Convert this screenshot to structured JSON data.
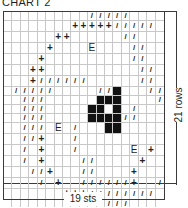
{
  "title": "CHART 2",
  "dimensions": {
    "width_label": "19 sts",
    "height_label": "21 rows",
    "columns": 19,
    "rows": 21
  },
  "legend_symbols": {
    "/": "slash",
    "+": "plus",
    "#": "filled-square",
    "E": "letter-E",
    ".": "empty"
  },
  "colors": {
    "ink": "#231f20",
    "gridline": "#c8c8c8",
    "filled": "#111111"
  },
  "grid": [
    "........../////....",
    "........+++++/////.",
    "......++......//...",
    ".....+....E....//..",
    "....+..........//..",
    "...++...........//.",
    "...+//////......//.",
    "./////.....//#...//+",
    "../// .....###..../+",
    "..///.....##.#./...+",
    "..///.....####//...",
    "..///.E./...##.....+",
    "..//+.../..........+",
    "../.+.../......E.+.",
    "../.+....//.....+..",
    "...//+...//....+...",
    "..../.+..//////+..//",
    ".......+++////////.",
    "...........////....",
    ".............//....",
    "............../...."
  ]
}
